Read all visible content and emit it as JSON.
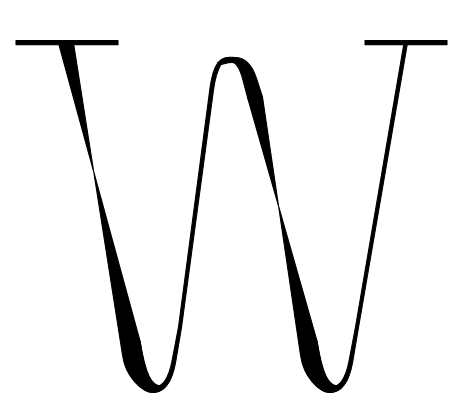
{
  "artwork": {
    "title": "W",
    "character": "W",
    "description": "Capital letter W letterform",
    "style": "didone-modern-serif",
    "ink_color": "#000000",
    "background_color": "#ffffff",
    "canvas_width": 467,
    "canvas_height": 413
  },
  "glyph": {
    "name": "capital-w",
    "cap_top_y": 42,
    "baseline_y": 393,
    "left_edge_x": 16,
    "right_edge_x": 447,
    "thick_stroke_width": 14,
    "thin_stroke_width": 3,
    "serif_thickness": 4,
    "apex_top_y": 57
  },
  "strokes": [
    {
      "name": "left-serif",
      "type": "serif-bar",
      "x_start": 16,
      "x_end": 118,
      "y": 42,
      "thickness": 4,
      "path": "M16 40.6 L118 40.6 L118 44.6 L16 44.6 Z"
    },
    {
      "name": "first-thick-diagonal",
      "type": "thick-downstroke",
      "from": [
        59,
        43
      ],
      "to": [
        152,
        393
      ],
      "weight": "thick",
      "path": "M58.5 43 L73.5 43 L122.5 355 C125.5 377 142 392.5 153 392.5 C160 392.5 164.5 388.5 165.5 383.5 C160 388 153.5 385.5 149 376 C145.5 368.5 142 353 140 341 Z"
    },
    {
      "name": "first-bowl-bottom",
      "type": "rounded-bowl",
      "center_x": 153,
      "bottom_y": 393,
      "left_x": 128,
      "right_x": 180,
      "path": "M140 341 C144 366 147 381 153 387.5 C162 387.5 168.5 379.5 172 361 L178.5 327 L181.5 327.5 L175.5 363 C171.5 384.5 164 392.5 153 392.5 C142 392.5 133 381 129.5 357 Z"
    },
    {
      "name": "first-thin-upstroke",
      "type": "thin-upstroke",
      "from": [
        178,
        327
      ],
      "to": [
        214,
        70
      ],
      "weight": "thin",
      "path": "M178.5 327 L210 88 C211.5 77 214 68 218 62.5 L221 64.5 C217.5 70 215 79 213.5 90 L181.5 327.5 Z"
    },
    {
      "name": "middle-apex",
      "type": "rounded-arch",
      "peak_x": 233,
      "peak_y": 57,
      "left_x": 211,
      "right_x": 262,
      "path": "M218 62.5 C224 55.5 230 57.5 235 57.5 C244 57.5 252 64 256.5 78.5 L262.5 97 L248 99 L244 84 C241 71.5 237.5 62.5 232 62.5 C227.5 62.5 224 64 221 64.5 Z"
    },
    {
      "name": "second-thick-diagonal",
      "type": "thick-downstroke",
      "from": [
        252,
        72
      ],
      "to": [
        330,
        393
      ],
      "weight": "thick",
      "path": "M248 99 L262.5 97 L300.5 355 C303.5 377 319 392.5 330 392.5 C337 392.5 341.5 388.5 342.5 383.5 C337 388 330.5 385.5 326 376 C322.5 368.5 319 353 317 341 Z"
    },
    {
      "name": "second-bowl-bottom",
      "type": "rounded-bowl",
      "center_x": 330,
      "bottom_y": 392,
      "left_x": 305,
      "right_x": 358,
      "path": "M317 341 C321 366 324 381 330 387.5 C339 387.5 345.5 379.5 349 361 L355.5 327 L358.5 327.5 L352.5 363 C348.5 384.5 341 392.5 330 392.5 C319 392.5 310 381 306.5 357 Z"
    },
    {
      "name": "right-thin-upstroke",
      "type": "thin-upstroke",
      "from": [
        355,
        327
      ],
      "to": [
        406,
        43
      ],
      "weight": "thin",
      "path": "M355.5 327 L404 43 L407.5 43 L358.5 327.5 Z"
    },
    {
      "name": "right-serif",
      "type": "serif-bar",
      "x_start": 365,
      "x_end": 447,
      "y": 42,
      "thickness": 4,
      "path": "M365 40.6 L447 40.6 L447 44.6 L365 44.6 Z"
    }
  ]
}
